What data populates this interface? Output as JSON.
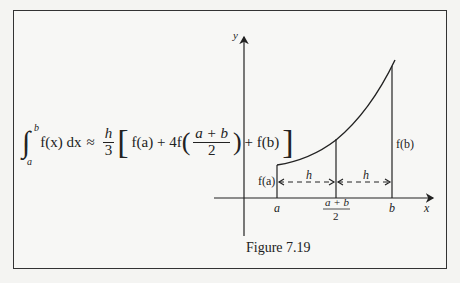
{
  "formula": {
    "integral_upper": "b",
    "integral_lower": "a",
    "integrand": "f(x) dx",
    "approx": "≈",
    "coef_num": "h",
    "coef_den": "3",
    "term1": "f(a) + 4f",
    "mid_num": "a + b",
    "mid_den": "2",
    "term3": "+ f(b)"
  },
  "diagram": {
    "y_axis_label": "y",
    "x_axis_label": "x",
    "tick_a": "a",
    "tick_mid_num": "a + b",
    "tick_mid_den": "2",
    "tick_b": "b",
    "label_fa": "f(a)",
    "label_fb": "f(b)",
    "h_left": "h",
    "h_right": "h"
  },
  "caption": "Figure 7.19",
  "colors": {
    "line": "#222222",
    "background": "#f7f7f5"
  }
}
